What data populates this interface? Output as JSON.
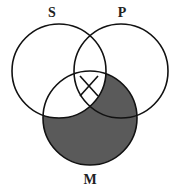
{
  "diagram": {
    "type": "venn-three-set",
    "labels": {
      "s": "S",
      "p": "P",
      "m": "M"
    },
    "circles": {
      "s": {
        "cx": 59,
        "cy": 71,
        "r": 47
      },
      "p": {
        "cx": 121,
        "cy": 71,
        "r": 47
      },
      "m": {
        "cx": 90,
        "cy": 118,
        "r": 47
      }
    },
    "shaded_regions": [
      "M minus S (M outside S)"
    ],
    "marked_regions": [
      {
        "region": "S∩P∩M... S∩P outside M? (X marks S∩P∩M upper lens)",
        "mark": "X"
      }
    ],
    "colors": {
      "stroke": "#111111",
      "shade": "#555555",
      "background": "#ffffff"
    }
  }
}
